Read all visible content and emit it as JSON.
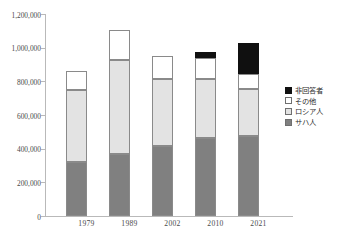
{
  "chart_data": {
    "type": "bar",
    "subtype": "stacked-bar",
    "title": "",
    "xlabel": "",
    "ylabel": "",
    "categories": [
      "1979",
      "1989",
      "2002",
      "2010",
      "2021"
    ],
    "ylim": [
      0,
      1200000
    ],
    "ytick_labels": [
      "1,200,000",
      "1,000,000",
      "800,000",
      "600,000",
      "400,000",
      "200,000",
      "0"
    ],
    "ytick_values": [
      1200000,
      1000000,
      800000,
      600000,
      400000,
      200000,
      0
    ],
    "grid": false,
    "legend_position": "right",
    "stack_order_bottom_to_top": [
      "サハ人",
      "ロシア人",
      "その他",
      "非回答者"
    ],
    "series": [
      {
        "name": "サハ人",
        "color": "#808080",
        "values": [
          320000,
          368000,
          416000,
          463000,
          475000
        ]
      },
      {
        "name": "ロシア人",
        "color": "#e3e3e3",
        "values": [
          430000,
          559000,
          398000,
          351000,
          279000
        ]
      },
      {
        "name": "その他",
        "color": "#ffffff",
        "values": [
          111000,
          178000,
          136000,
          124000,
          89000
        ]
      },
      {
        "name": "非回答者",
        "color": "#101010",
        "values": [
          0,
          0,
          0,
          36000,
          184000
        ]
      }
    ],
    "cumulative_tops": [
      [
        320000,
        750000,
        861000,
        861000
      ],
      [
        368000,
        927000,
        1105000,
        1105000
      ],
      [
        416000,
        814000,
        950000,
        950000
      ],
      [
        463000,
        814000,
        938000,
        974000
      ],
      [
        475000,
        754000,
        843000,
        1027000
      ]
    ]
  },
  "legend": {
    "items": [
      {
        "label": "非回答者",
        "swatch": "black-swatch"
      },
      {
        "label": "その他",
        "swatch": "white-swatch"
      },
      {
        "label": "ロシア人",
        "swatch": "light-gray-swatch"
      },
      {
        "label": "サハ人",
        "swatch": "gray-swatch"
      }
    ]
  },
  "axis": {
    "y_labels": [
      "1,200,000",
      "1,000,000",
      "800,000",
      "600,000",
      "400,000",
      "200,000",
      "0"
    ],
    "x_labels": [
      "1979",
      "1989",
      "2002",
      "2010",
      "2021"
    ]
  }
}
